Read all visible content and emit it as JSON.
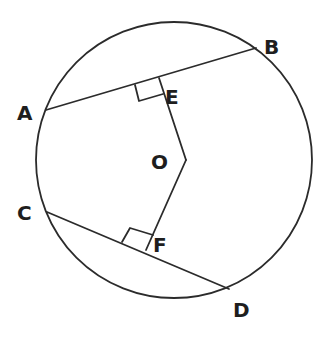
{
  "diagram": {
    "type": "geometry",
    "circle": {
      "cx": 174,
      "cy": 160,
      "r": 138
    },
    "points": {
      "A": {
        "x": 46,
        "y": 110,
        "label": "A",
        "lx": 17,
        "ly": 120
      },
      "B": {
        "x": 256,
        "y": 48,
        "label": "B",
        "lx": 264,
        "ly": 52
      },
      "C": {
        "x": 47,
        "y": 212,
        "label": "C",
        "lx": 17,
        "ly": 219
      },
      "D": {
        "x": 229,
        "y": 289,
        "label": "D",
        "lx": 233,
        "ly": 316
      },
      "E": {
        "x": 159,
        "y": 78,
        "label": "E",
        "lx": 164,
        "ly": 104
      },
      "F": {
        "x": 146,
        "y": 250,
        "label": "F",
        "lx": 153,
        "ly": 252
      },
      "O": {
        "x": 186,
        "y": 160,
        "label": "O",
        "lx": 152,
        "ly": 168
      }
    },
    "segments": [
      {
        "name": "chord-AB",
        "from": "A",
        "to": "B"
      },
      {
        "name": "chord-CD",
        "from": "C",
        "to": "D"
      },
      {
        "name": "segment-OE",
        "from": "O",
        "to": "E"
      },
      {
        "name": "segment-OF",
        "from": "O",
        "to": "F"
      }
    ],
    "right_angle_marks": [
      {
        "at": "E",
        "points": "159,78 135,85 139,101 163,94"
      },
      {
        "at": "F",
        "points": "146,250 122,242 130,228 153,235"
      }
    ],
    "labels": {
      "A": "A",
      "B": "B",
      "C": "C",
      "D": "D",
      "E": "E",
      "F": "F",
      "O": "O"
    }
  }
}
